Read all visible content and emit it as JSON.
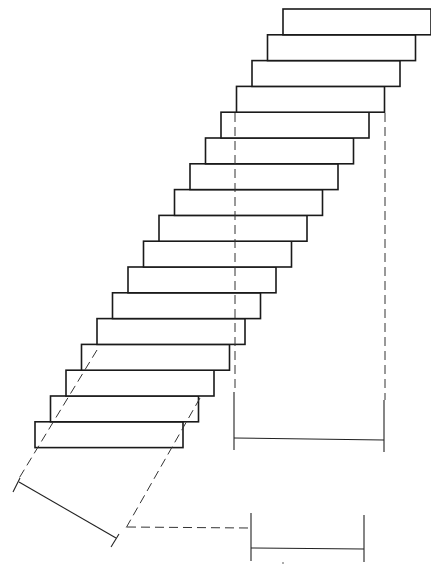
{
  "diagram": {
    "type": "staircase-line-drawing",
    "colors": {
      "line": "#1a1a1a",
      "background": "#ffffff"
    },
    "steps": {
      "count": 17,
      "top_x": 283,
      "top_y": 9,
      "width": 148,
      "rise": 25.8,
      "shift_left": 15.5
    },
    "vertical_projection": {
      "dashed_lines_x": [
        233,
        385
      ],
      "dashed_top_y": 113,
      "dimension_y": 440,
      "dimension_label": ""
    },
    "inclined_projection": {
      "dashed_line_a": [
        [
          95,
          250
        ],
        [
          15,
          490
        ]
      ],
      "dashed_line_b": [
        [
          200,
          390
        ],
        [
          113,
          546
        ]
      ],
      "dimension_line": [
        [
          19,
          482
        ],
        [
          116,
          538
        ]
      ],
      "leader_to_x": 248,
      "leader_y": 528
    },
    "bottom_dimension": {
      "x1": 251,
      "x2": 364,
      "y": 549,
      "label": ""
    }
  }
}
